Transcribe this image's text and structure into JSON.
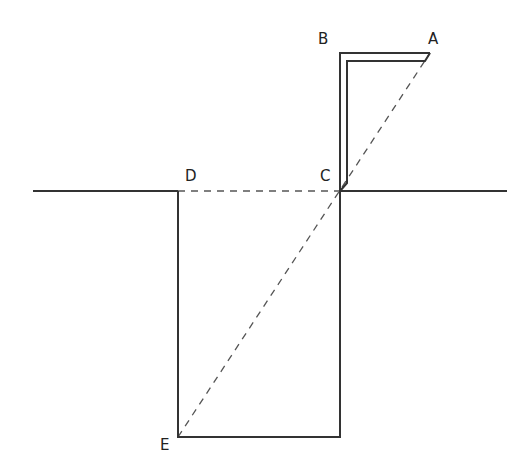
{
  "diagram": {
    "type": "geometric-figure",
    "labels": {
      "A": "A",
      "B": "B",
      "C": "C",
      "D": "D",
      "E": "E"
    },
    "colors": {
      "line": "#333333",
      "dashed": "#555555",
      "background": "#ffffff"
    }
  }
}
